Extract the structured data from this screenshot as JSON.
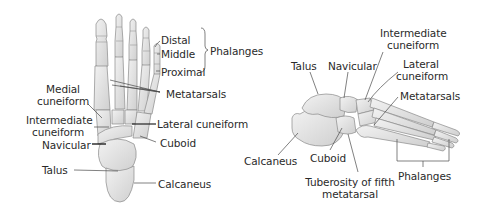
{
  "figure": {
    "background": "#ffffff",
    "bone_fill": "#e4e4e4",
    "bone_stroke": "#8a8a8a",
    "line_color": "#4a4a4a",
    "text_color": "#2a2a2a"
  },
  "superior_view": {
    "labels": {
      "distal": "Distal",
      "middle": "Middle",
      "proximal": "Proximal",
      "phalanges": "Phalanges",
      "metatarsals": "Metatarsals",
      "medial_cuneiform_1": "Medial",
      "medial_cuneiform_2": "cuneiform",
      "intermediate_cuneiform_1": "Intermediate",
      "intermediate_cuneiform_2": "cuneiform",
      "navicular": "Navicular",
      "lateral_cuneiform": "Lateral cuneiform",
      "cuboid": "Cuboid",
      "talus": "Talus",
      "calcaneus": "Calcaneus"
    }
  },
  "lateral_view": {
    "labels": {
      "intermediate_cuneiform_1": "Intermediate",
      "intermediate_cuneiform_2": "cuneiform",
      "lateral_cuneiform_1": "Lateral",
      "lateral_cuneiform_2": "cuneiform",
      "talus": "Talus",
      "navicular": "Navicular",
      "metatarsals": "Metatarsals",
      "calcaneus": "Calcaneus",
      "cuboid": "Cuboid",
      "tuberosity_1": "Tuberosity of fifth",
      "tuberosity_2": "metatarsal",
      "phalanges": "Phalanges"
    }
  }
}
